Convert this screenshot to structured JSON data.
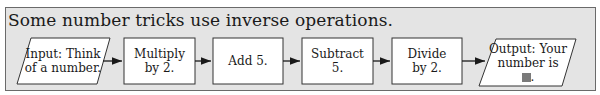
{
  "title": "Some number tricks use inverse operations.",
  "flowchart": {
    "steps": [
      {
        "type": "input",
        "line1": "Input: Think",
        "line2": "of a number."
      },
      {
        "type": "process",
        "line1": "Multiply",
        "line2": "by 2."
      },
      {
        "type": "process",
        "line1": "Add 5.",
        "line2": ""
      },
      {
        "type": "process",
        "line1": "Subtract",
        "line2": "5."
      },
      {
        "type": "process",
        "line1": "Divide",
        "line2": "by 2."
      },
      {
        "type": "output",
        "line1": "Output: Your",
        "line2": "number is",
        "line3": "."
      }
    ],
    "blank_color": "#7a7a7a"
  }
}
